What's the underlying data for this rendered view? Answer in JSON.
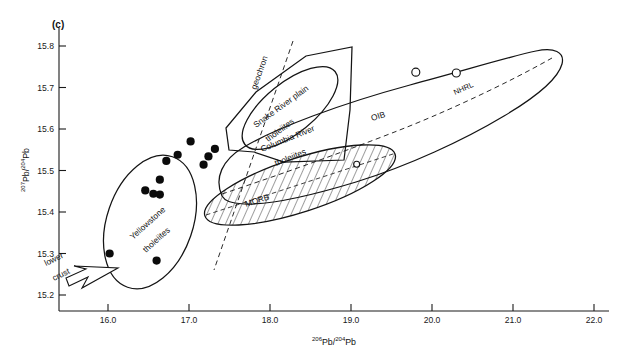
{
  "figure": {
    "panel_label": "(c)",
    "background": "#ffffff",
    "ink": "#141414"
  },
  "chart_data": {
    "type": "scatter",
    "title": "",
    "panel": "(c)",
    "xlabel": "206Pb/204Pb",
    "ylabel": "207Pb/204Pb",
    "xlabel_parts": {
      "sup1": "206",
      "mid": "Pb/",
      "sup2": "204",
      "end": "Pb"
    },
    "ylabel_parts": {
      "sup1": "207",
      "mid": "Pb/",
      "sup2": "204",
      "end": "Pb"
    },
    "xlim": [
      15.6,
      22.2
    ],
    "ylim": [
      15.15,
      15.86
    ],
    "xticks": [
      "16.0",
      "17.0",
      "18.0",
      "19.0",
      "20.0",
      "21.0",
      "22.0"
    ],
    "xtick_values": [
      16.0,
      17.0,
      18.0,
      19.0,
      20.0,
      21.0,
      22.0
    ],
    "yticks": [
      "15.2",
      "15.3",
      "15.4",
      "15.5",
      "15.6",
      "15.7",
      "15.8"
    ],
    "ytick_values": [
      15.2,
      15.3,
      15.4,
      15.5,
      15.6,
      15.7,
      15.8
    ],
    "grid": false,
    "legend": "none",
    "series": [
      {
        "name": "Yellowstone tholeiites",
        "marker": "filled-circle",
        "points": [
          {
            "x": 17.02,
            "y": 15.57
          },
          {
            "x": 17.32,
            "y": 15.552
          },
          {
            "x": 16.86,
            "y": 15.538
          },
          {
            "x": 17.24,
            "y": 15.534
          },
          {
            "x": 16.72,
            "y": 15.523
          },
          {
            "x": 17.18,
            "y": 15.514
          },
          {
            "x": 16.64,
            "y": 15.478
          },
          {
            "x": 16.46,
            "y": 15.452
          },
          {
            "x": 16.56,
            "y": 15.444
          },
          {
            "x": 16.64,
            "y": 15.442
          },
          {
            "x": 16.02,
            "y": 15.3
          },
          {
            "x": 16.6,
            "y": 15.283
          }
        ]
      },
      {
        "name": "open-circle points",
        "marker": "open-circle",
        "points": [
          {
            "x": 19.8,
            "y": 15.737
          },
          {
            "x": 20.3,
            "y": 15.735
          },
          {
            "x": 19.07,
            "y": 15.515
          }
        ]
      }
    ],
    "fields": [
      {
        "name": "Yellowstone tholeiites",
        "shape": "ellipse-outline",
        "label": "Yellowstone tholeiites"
      },
      {
        "name": "Snake River plain tholeiites",
        "shape": "ellipse-outline",
        "label": "Snake River plain tholeiites"
      },
      {
        "name": "Columbia River tholeiites",
        "shape": "polygon-outline",
        "label": "Columbia River tholeiites"
      },
      {
        "name": "MORB",
        "shape": "hatched-ellipse",
        "label": "MORB"
      },
      {
        "name": "OIB",
        "shape": "elongate-outline",
        "label": "OIB"
      }
    ],
    "reference_lines": [
      {
        "name": "geochron",
        "label": "geochron",
        "style": "dashed"
      },
      {
        "name": "NHRL",
        "label": "NHRL",
        "style": "dashed"
      },
      {
        "name": "MORB axis",
        "label": "",
        "style": "dashed"
      }
    ],
    "annotations": [
      {
        "name": "lower-crust",
        "label_line1": "lower",
        "label_line2": "crust",
        "marker": "arrow"
      }
    ]
  },
  "labels": {
    "panel": "(c)",
    "yellowstone_l1": "Yellowstone",
    "yellowstone_l2": "tholeiites",
    "snake_l1": "Snake River plain",
    "snake_l2": "tholeiites",
    "columbia_l1": "Columbia River",
    "columbia_l2": "tholeiites",
    "morb": "MORB",
    "oib": "OIB",
    "geochron": "geochron",
    "nhrl": "NHRL",
    "lower": "lower",
    "crust": "crust"
  }
}
